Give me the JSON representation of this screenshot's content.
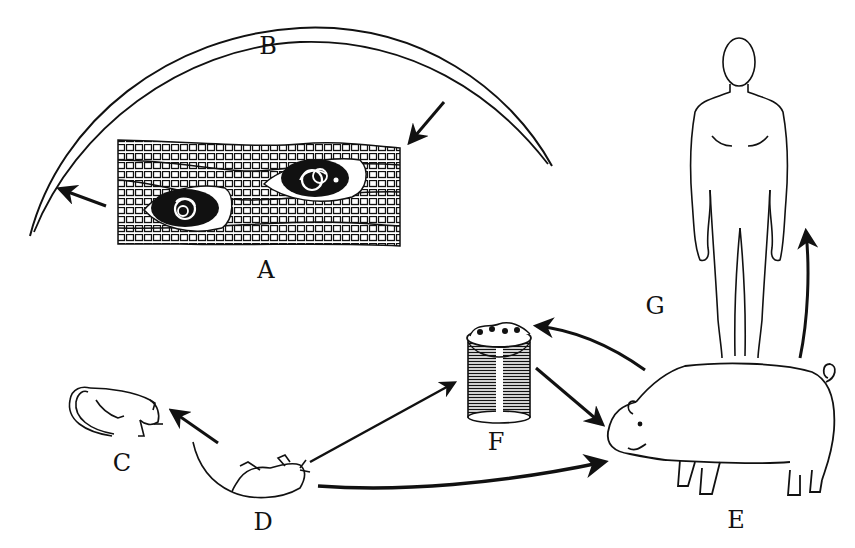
{
  "diagram": {
    "labels": {
      "A": "A",
      "B": "B",
      "C": "C",
      "D": "D",
      "E": "E",
      "F": "F",
      "G": "G"
    },
    "nodes": [
      {
        "id": "A",
        "depicts": "muscle tissue with encysted larvae"
      },
      {
        "id": "B",
        "depicts": "adult worm"
      },
      {
        "id": "C",
        "depicts": "cat"
      },
      {
        "id": "D",
        "depicts": "rat"
      },
      {
        "id": "E",
        "depicts": "pig"
      },
      {
        "id": "F",
        "depicts": "garbage pail"
      },
      {
        "id": "G",
        "depicts": "human"
      }
    ],
    "edges": [
      {
        "from": "B",
        "to": "A"
      },
      {
        "from": "A",
        "to": "B"
      },
      {
        "from": "D",
        "to": "C"
      },
      {
        "from": "D",
        "to": "F"
      },
      {
        "from": "D",
        "to": "E"
      },
      {
        "from": "F",
        "to": "E"
      },
      {
        "from": "E",
        "to": "F"
      },
      {
        "from": "E",
        "to": "G"
      }
    ],
    "colors": {
      "ink": "#111111",
      "paper": "#ffffff"
    }
  }
}
